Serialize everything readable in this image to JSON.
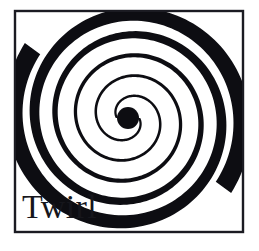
{
  "card": {
    "name": "twirl-logo-card",
    "background_color": "#ffffff",
    "width": 259,
    "height": 251
  },
  "frame": {
    "name": "logo-frame",
    "stroke_color": "#1b1b22",
    "stroke_width": 2.4,
    "x": 15,
    "y": 11,
    "width": 228,
    "height": 221
  },
  "artwork": {
    "name": "twirl-spiral",
    "type": "double-arm-archimedean-spiral",
    "ink_color": "#0d0d12",
    "center_x": 128,
    "center_y": 118,
    "core_radius": 11,
    "arm_count": 2,
    "turns": 2.6,
    "max_radius": 118,
    "description": "Two interleaved spiral arms widening from a solid dark core and exiting the frame at left and right as thick wedges"
  },
  "caption": {
    "name": "logo-caption",
    "text": "Twirl",
    "color": "#16161c",
    "font_size_px": 34,
    "x": 22,
    "baseline_y": 218
  }
}
